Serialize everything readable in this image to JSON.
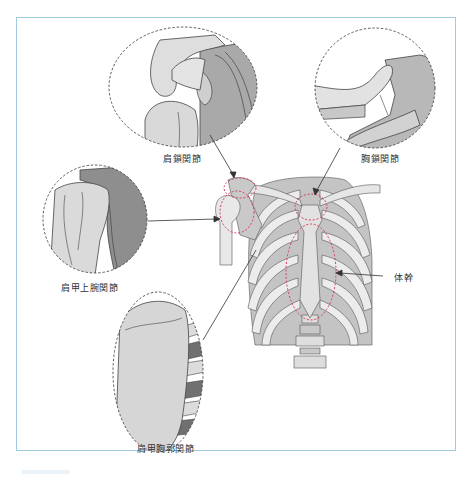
{
  "figure": {
    "frame_color": "#9ecbe0",
    "highlight_color": "#d63a5a",
    "bone_fill": "#e9e9e9",
    "bone_shade": "#bdbdbd",
    "bone_dark": "#8f8f8f",
    "outline": "#444444"
  },
  "labels": {
    "acromioclavicular": "肩鎖関節",
    "sternoclavicular": "胸鎖関節",
    "glenohumeral": "肩甲上腕関節",
    "scapulothoracic": "肩甲胸郭関節",
    "trunk": "体幹"
  }
}
